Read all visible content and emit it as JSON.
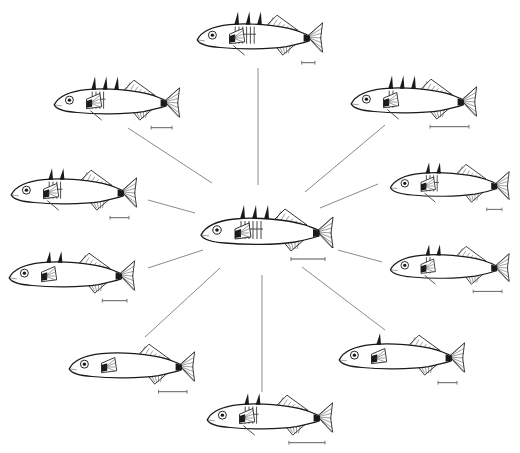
{
  "diagram": {
    "colors": {
      "line": "#1a1a1a",
      "connector": "#8a8a8a",
      "background": "#ffffff"
    },
    "center": {
      "id": "ancestral",
      "x": 265,
      "y": 233,
      "scale": 1.0,
      "armor": "full",
      "spines": 3,
      "scale_bar": 34
    },
    "fish": [
      {
        "id": "top",
        "x": 258,
        "y": 38,
        "scale": 0.95,
        "armor": "full",
        "spines": 3,
        "pelvic": true,
        "scale_bar": 14,
        "connector": [
          [
            258,
            68
          ],
          [
            258,
            185
          ]
        ]
      },
      {
        "id": "upper-left",
        "x": 115,
        "y": 103,
        "scale": 0.95,
        "armor": "partial",
        "spines": 3,
        "pelvic": true,
        "scale_bar": 22,
        "connector": [
          [
            128,
            128
          ],
          [
            212,
            183
          ]
        ]
      },
      {
        "id": "upper-right",
        "x": 412,
        "y": 102,
        "scale": 0.95,
        "armor": "low",
        "spines": 3,
        "pelvic": true,
        "scale_bar": 41,
        "connector": [
          [
            385,
            125
          ],
          [
            305,
            192
          ]
        ]
      },
      {
        "id": "left-mid",
        "x": 72,
        "y": 193,
        "scale": 0.95,
        "armor": "partial",
        "spines": 2,
        "pelvic": true,
        "scale_bar": 20,
        "connector": [
          [
            148,
            200
          ],
          [
            195,
            213
          ]
        ]
      },
      {
        "id": "right-mid",
        "x": 448,
        "y": 186,
        "scale": 0.9,
        "armor": "partial",
        "spines": 2,
        "pelvic": true,
        "scale_bar": 17,
        "connector": [
          [
            378,
            184
          ],
          [
            320,
            208
          ]
        ]
      },
      {
        "id": "left-low",
        "x": 70,
        "y": 276,
        "scale": 0.95,
        "armor": "none",
        "spines": 2,
        "pelvic": false,
        "scale_bar": 26,
        "connector": [
          [
            148,
            268
          ],
          [
            203,
            250
          ]
        ]
      },
      {
        "id": "right-low",
        "x": 448,
        "y": 268,
        "scale": 0.9,
        "armor": "low",
        "spines": 2,
        "pelvic": true,
        "scale_bar": 32,
        "connector": [
          [
            382,
            262
          ],
          [
            338,
            250
          ]
        ]
      },
      {
        "id": "bottom-left",
        "x": 130,
        "y": 367,
        "scale": 0.95,
        "armor": "none",
        "spines": 0,
        "pelvic": false,
        "scale_bar": 30,
        "connector": [
          [
            145,
            337
          ],
          [
            220,
            268
          ]
        ]
      },
      {
        "id": "bottom-right",
        "x": 400,
        "y": 358,
        "scale": 0.95,
        "armor": "none",
        "spines": 1,
        "pelvic": false,
        "scale_bar": 20,
        "connector": [
          [
            385,
            330
          ],
          [
            302,
            267
          ]
        ]
      },
      {
        "id": "bottom",
        "x": 268,
        "y": 418,
        "scale": 0.95,
        "armor": "partial",
        "spines": 2,
        "pelvic": true,
        "scale_bar": 38,
        "connector": [
          [
            262,
            392
          ],
          [
            262,
            275
          ]
        ]
      }
    ]
  }
}
